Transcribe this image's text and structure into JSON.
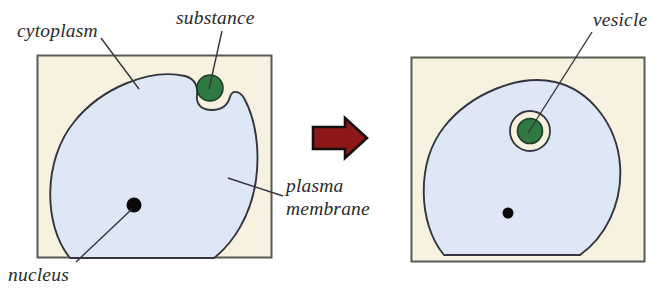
{
  "figure": {
    "panels": [
      {
        "id": "before",
        "labels": {
          "cytoplasm": "cytoplasm",
          "substance": "substance",
          "plasma_membrane_line1": "plasma",
          "plasma_membrane_line2": "membrane",
          "nucleus": "nucleus"
        }
      },
      {
        "id": "after",
        "labels": {
          "vesicle": "vesicle"
        }
      }
    ]
  },
  "colors": {
    "background": "#ffffff",
    "box_fill": "#f7f2df",
    "box_stroke": "#595a55",
    "cytoplasm_fill": "#dde7f5",
    "membrane_stroke": "#35353f",
    "substance_fill": "#2f7a42",
    "substance_stroke": "#1d3d27",
    "vesicle_fill": "#f7f2df",
    "vesicle_stroke": "#35353f",
    "nucleus_fill": "#0a0a0a",
    "arrow_fill": "#8e1818",
    "arrow_stroke": "#14100f",
    "leader_stroke": "#35353f",
    "label_text": "#2b2b2b"
  },
  "geometry": {
    "panel_left": {
      "x": 37,
      "y": 55,
      "w": 235,
      "h": 203
    },
    "panel_right": {
      "x": 411,
      "y": 57,
      "w": 234,
      "h": 205
    },
    "arrow": {
      "x": 313,
      "y": 118,
      "w": 54,
      "h": 40
    },
    "substance": {
      "cx": 210,
      "cy": 88,
      "r": 13
    },
    "vesicle_outer": {
      "cx": 530,
      "cy": 131,
      "r": 20
    },
    "vesicle_inner": {
      "cx": 530,
      "cy": 131,
      "r": 12.5
    },
    "nucleus_left": {
      "cx": 134,
      "cy": 205,
      "r": 7.5
    },
    "nucleus_right": {
      "cx": 508,
      "cy": 213,
      "r": 5.5
    }
  }
}
